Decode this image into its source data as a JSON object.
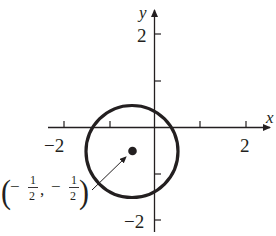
{
  "diagram": {
    "type": "circle-graph",
    "axes": {
      "x_label": "x",
      "y_label": "y",
      "x_tick_labels": [
        {
          "value": -2,
          "text": "−2"
        },
        {
          "value": 2,
          "text": "2"
        }
      ],
      "y_tick_labels": [
        {
          "value": 2,
          "text": "2"
        },
        {
          "value": -2,
          "text": "−2"
        }
      ],
      "x_ticks": [
        -2,
        -1,
        1,
        2
      ],
      "y_ticks": [
        2,
        1,
        -1,
        -2
      ]
    },
    "circle": {
      "center": [
        -0.5,
        -0.5
      ],
      "radius": 1
    },
    "annotation": {
      "open": "(",
      "minus1": "−",
      "num1": "1",
      "den1": "2",
      "comma": ",",
      "minus2": "−",
      "num2": "1",
      "den2": "2",
      "close": ")"
    },
    "colors": {
      "ink": "#231f20",
      "background": "#ffffff"
    }
  }
}
